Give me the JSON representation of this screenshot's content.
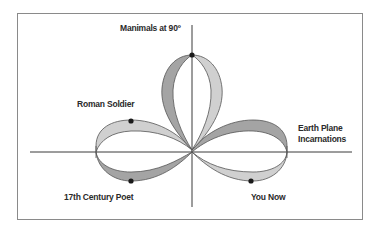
{
  "diagram": {
    "type": "trefoil-loop-diagram",
    "colors": {
      "frame": "#8a8a8a",
      "axis": "#3a3a3a",
      "band_light": "#d0d0d0",
      "band_dark": "#a4a4a4",
      "band_outline": "#555555",
      "node": "#1a1a1a"
    },
    "labels": {
      "top": "Manimals at 90º",
      "upper_left": "Roman Soldier",
      "right_line1": "Earth Plane",
      "right_line2": "Incarnations",
      "lower_left": "17th Century Poet",
      "lower_right": "You Now"
    },
    "nodes": [
      {
        "name": "manimals-node",
        "x": 192,
        "y": 55
      },
      {
        "name": "roman-soldier-node",
        "x": 131,
        "y": 121
      },
      {
        "name": "poet-node",
        "x": 131,
        "y": 181
      },
      {
        "name": "you-now-node",
        "x": 251,
        "y": 181
      }
    ]
  }
}
